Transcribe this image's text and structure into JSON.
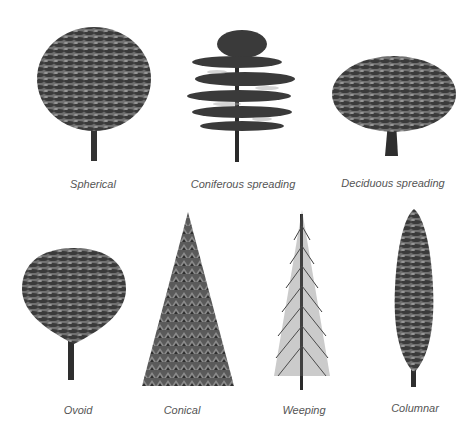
{
  "diagram": {
    "trees": [
      {
        "id": "spherical",
        "label": "Spherical"
      },
      {
        "id": "coniferous-spreading",
        "label": "Coniferous spreading"
      },
      {
        "id": "deciduous-spreading",
        "label": "Deciduous spreading"
      },
      {
        "id": "ovoid",
        "label": "Ovoid"
      },
      {
        "id": "conical",
        "label": "Conical"
      },
      {
        "id": "weeping",
        "label": "Weeping"
      },
      {
        "id": "columnar",
        "label": "Columnar"
      }
    ],
    "colors": {
      "foliage_dark": "#2e2e2e",
      "foliage_mid": "#6a6a6a",
      "foliage_light": "#9a9a9a",
      "trunk": "#333333",
      "label": "#555555"
    }
  }
}
